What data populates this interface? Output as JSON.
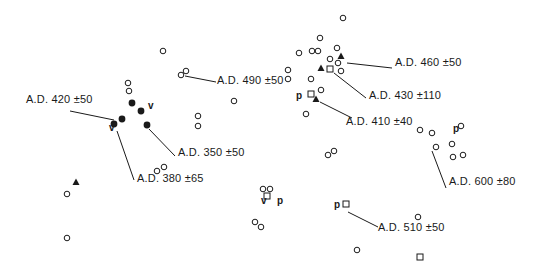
{
  "diagram": {
    "type": "site-distribution-map",
    "colors": {
      "ink": "#1a1a1a",
      "background": "#ffffff"
    },
    "symbols": {
      "open_circle": "open-circle",
      "filled_circle": "filled-circle",
      "filled_triangle": "filled-triangle",
      "open_square": "open-square"
    },
    "points": [
      {
        "shape": "open_circle",
        "x": 163,
        "y": 51
      },
      {
        "shape": "open_circle",
        "x": 181,
        "y": 75
      },
      {
        "shape": "open_circle",
        "x": 186,
        "y": 71
      },
      {
        "shape": "open_circle",
        "x": 128,
        "y": 83
      },
      {
        "shape": "open_circle",
        "x": 129,
        "y": 91
      },
      {
        "shape": "open_circle",
        "x": 234,
        "y": 101
      },
      {
        "shape": "open_circle",
        "x": 198,
        "y": 116
      },
      {
        "shape": "open_circle",
        "x": 198,
        "y": 126
      },
      {
        "shape": "filled_circle",
        "x": 132,
        "y": 103
      },
      {
        "shape": "filled_circle",
        "x": 141,
        "y": 111
      },
      {
        "shape": "filled_circle",
        "x": 122,
        "y": 119
      },
      {
        "shape": "filled_circle",
        "x": 114,
        "y": 124
      },
      {
        "shape": "filled_circle",
        "x": 147,
        "y": 125
      },
      {
        "shape": "open_circle",
        "x": 157,
        "y": 171
      },
      {
        "shape": "open_circle",
        "x": 164,
        "y": 167
      },
      {
        "shape": "filled_triangle",
        "x": 76,
        "y": 182
      },
      {
        "shape": "open_circle",
        "x": 67,
        "y": 194
      },
      {
        "shape": "open_circle",
        "x": 67,
        "y": 238
      },
      {
        "shape": "open_circle",
        "x": 343,
        "y": 18
      },
      {
        "shape": "open_circle",
        "x": 320,
        "y": 38
      },
      {
        "shape": "open_circle",
        "x": 318,
        "y": 51
      },
      {
        "shape": "open_circle",
        "x": 299,
        "y": 53
      },
      {
        "shape": "open_circle",
        "x": 312,
        "y": 51
      },
      {
        "shape": "open_circle",
        "x": 337,
        "y": 48
      },
      {
        "shape": "filled_triangle",
        "x": 341,
        "y": 56
      },
      {
        "shape": "open_circle",
        "x": 330,
        "y": 59
      },
      {
        "shape": "open_circle",
        "x": 338,
        "y": 63
      },
      {
        "shape": "filled_triangle",
        "x": 321,
        "y": 68
      },
      {
        "shape": "open_square",
        "x": 330,
        "y": 69
      },
      {
        "shape": "open_circle",
        "x": 341,
        "y": 71
      },
      {
        "shape": "open_circle",
        "x": 288,
        "y": 70
      },
      {
        "shape": "open_circle",
        "x": 288,
        "y": 79
      },
      {
        "shape": "open_circle",
        "x": 311,
        "y": 79
      },
      {
        "shape": "open_circle",
        "x": 321,
        "y": 90
      },
      {
        "shape": "open_square",
        "x": 311,
        "y": 94
      },
      {
        "shape": "filled_triangle",
        "x": 316,
        "y": 99
      },
      {
        "shape": "open_circle",
        "x": 306,
        "y": 114
      },
      {
        "shape": "open_circle",
        "x": 420,
        "y": 130
      },
      {
        "shape": "open_circle",
        "x": 432,
        "y": 133
      },
      {
        "shape": "open_circle",
        "x": 461,
        "y": 126
      },
      {
        "shape": "open_circle",
        "x": 436,
        "y": 147
      },
      {
        "shape": "open_circle",
        "x": 452,
        "y": 144
      },
      {
        "shape": "open_circle",
        "x": 453,
        "y": 157
      },
      {
        "shape": "open_circle",
        "x": 463,
        "y": 155
      },
      {
        "shape": "open_circle",
        "x": 328,
        "y": 155
      },
      {
        "shape": "open_circle",
        "x": 334,
        "y": 151
      },
      {
        "shape": "open_circle",
        "x": 263,
        "y": 189
      },
      {
        "shape": "open_circle",
        "x": 270,
        "y": 189
      },
      {
        "shape": "open_square",
        "x": 267,
        "y": 196
      },
      {
        "shape": "open_circle",
        "x": 255,
        "y": 222
      },
      {
        "shape": "open_circle",
        "x": 261,
        "y": 227
      },
      {
        "shape": "open_square",
        "x": 346,
        "y": 204
      },
      {
        "shape": "open_circle",
        "x": 418,
        "y": 217
      },
      {
        "shape": "open_circle",
        "x": 357,
        "y": 250
      },
      {
        "shape": "open_square",
        "x": 420,
        "y": 257
      }
    ],
    "letters": [
      {
        "text": "v",
        "x": 151,
        "y": 107
      },
      {
        "text": "v",
        "x": 112,
        "y": 129
      },
      {
        "text": "p",
        "x": 299,
        "y": 97
      },
      {
        "text": "p",
        "x": 456,
        "y": 130
      },
      {
        "text": "v",
        "x": 264,
        "y": 202
      },
      {
        "text": "p",
        "x": 280,
        "y": 202
      },
      {
        "text": "p",
        "x": 337,
        "y": 206
      }
    ],
    "date_labels": [
      {
        "text": "A.D. 420 ±50",
        "x": 26,
        "y": 99,
        "line": [
          70,
          111,
          114,
          120
        ]
      },
      {
        "text": "A.D. 490 ±50",
        "x": 217,
        "y": 80,
        "line": [
          185,
          76,
          216,
          82
        ]
      },
      {
        "text": "A.D. 460 ±50",
        "x": 395,
        "y": 62,
        "line": [
          347,
          63,
          392,
          68
        ]
      },
      {
        "text": "A.D. 430 ±50",
        "x": 369,
        "y": 95,
        "line": [
          334,
          73,
          366,
          98
        ],
        "display": "A.D. 430 ±110"
      },
      {
        "text": "A.D. 410 ±40",
        "x": 346,
        "y": 121,
        "line": [
          320,
          102,
          352,
          118
        ]
      },
      {
        "text": "A.D. 350 ±50",
        "x": 178,
        "y": 152,
        "line": [
          149,
          129,
          175,
          156
        ]
      },
      {
        "text": "A.D. 380 ±65",
        "x": 137,
        "y": 178,
        "line": [
          117,
          131,
          134,
          180
        ]
      },
      {
        "text": "A.D. 600 ±80",
        "x": 449,
        "y": 181,
        "line": [
          432,
          151,
          446,
          188
        ]
      },
      {
        "text": "A.D. 510 ±50",
        "x": 378,
        "y": 227,
        "line": [
          348,
          212,
          378,
          227
        ]
      }
    ]
  }
}
